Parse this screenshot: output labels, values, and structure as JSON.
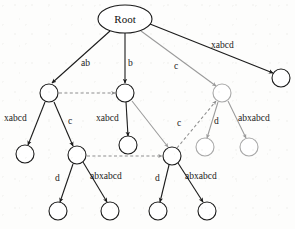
{
  "diagram": {
    "type": "suffix-tree",
    "root": {
      "id": "root",
      "label": "Root",
      "cx": 125,
      "cy": 19,
      "rx": 27,
      "ry": 14,
      "style": "dark"
    },
    "nodes": [
      {
        "id": "n1",
        "cx": 49,
        "cy": 93,
        "r": 9,
        "style": "dark"
      },
      {
        "id": "n2",
        "cx": 125,
        "cy": 93,
        "r": 9,
        "style": "dark"
      },
      {
        "id": "n3",
        "cx": 222,
        "cy": 93,
        "r": 9,
        "style": "gray"
      },
      {
        "id": "n4",
        "cx": 281,
        "cy": 78,
        "r": 9,
        "style": "dark"
      },
      {
        "id": "n5",
        "cx": 25,
        "cy": 154,
        "r": 9,
        "style": "dark"
      },
      {
        "id": "n6",
        "cx": 77,
        "cy": 155,
        "r": 9,
        "style": "dark"
      },
      {
        "id": "n7",
        "cx": 128,
        "cy": 145,
        "r": 9,
        "style": "dark"
      },
      {
        "id": "n8",
        "cx": 172,
        "cy": 156,
        "r": 9,
        "style": "dark"
      },
      {
        "id": "n9",
        "cx": 205,
        "cy": 147,
        "r": 9,
        "style": "gray"
      },
      {
        "id": "n10",
        "cx": 249,
        "cy": 147,
        "r": 9,
        "style": "gray"
      },
      {
        "id": "n11",
        "cx": 58,
        "cy": 211,
        "r": 9,
        "style": "dark"
      },
      {
        "id": "n12",
        "cx": 110,
        "cy": 211,
        "r": 9,
        "style": "dark"
      },
      {
        "id": "n13",
        "cx": 158,
        "cy": 211,
        "r": 9,
        "style": "dark"
      },
      {
        "id": "n14",
        "cx": 207,
        "cy": 211,
        "r": 9,
        "style": "dark"
      }
    ],
    "edges": [
      {
        "id": "e-root-n1",
        "from": "root",
        "to": "n1",
        "x1": 110,
        "y1": 31,
        "x2": 52,
        "y2": 83,
        "style": "dark"
      },
      {
        "id": "e-root-n2",
        "from": "root",
        "to": "n2",
        "x1": 125,
        "y1": 33,
        "x2": 125,
        "y2": 83,
        "style": "dark"
      },
      {
        "id": "e-root-n3",
        "from": "root",
        "to": "n3",
        "x1": 141,
        "y1": 31,
        "x2": 216,
        "y2": 86,
        "style": "gray"
      },
      {
        "id": "e-root-n4",
        "from": "root",
        "to": "n4",
        "x1": 150,
        "y1": 24,
        "x2": 273,
        "y2": 73,
        "style": "dark"
      },
      {
        "id": "e-n1-n5",
        "from": "n1",
        "to": "n5",
        "x1": 45,
        "y1": 102,
        "x2": 28,
        "y2": 145,
        "style": "dark"
      },
      {
        "id": "e-n1-n6",
        "from": "n1",
        "to": "n6",
        "x1": 54,
        "y1": 102,
        "x2": 73,
        "y2": 146,
        "style": "dark"
      },
      {
        "id": "e-n2-n7",
        "from": "n2",
        "to": "n7",
        "x1": 126,
        "y1": 102,
        "x2": 128,
        "y2": 136,
        "style": "dark"
      },
      {
        "id": "e-n2-n8",
        "from": "n2",
        "to": "n8",
        "x1": 132,
        "y1": 101,
        "x2": 168,
        "y2": 147,
        "style": "gray"
      },
      {
        "id": "e-n3-n9",
        "from": "n3",
        "to": "n9",
        "x1": 218,
        "y1": 102,
        "x2": 207,
        "y2": 138,
        "style": "gray"
      },
      {
        "id": "e-n3-n10",
        "from": "n3",
        "to": "n10",
        "x1": 228,
        "y1": 101,
        "x2": 246,
        "y2": 138,
        "style": "gray"
      },
      {
        "id": "e-n6-n11",
        "from": "n6",
        "to": "n11",
        "x1": 73,
        "y1": 164,
        "x2": 60,
        "y2": 202,
        "style": "dark"
      },
      {
        "id": "e-n6-n12",
        "from": "n6",
        "to": "n12",
        "x1": 83,
        "y1": 162,
        "x2": 107,
        "y2": 202,
        "style": "dark"
      },
      {
        "id": "e-n8-n13",
        "from": "n8",
        "to": "n13",
        "x1": 169,
        "y1": 165,
        "x2": 160,
        "y2": 202,
        "style": "dark"
      },
      {
        "id": "e-n8-n14",
        "from": "n8",
        "to": "n14",
        "x1": 178,
        "y1": 163,
        "x2": 203,
        "y2": 202,
        "style": "dark"
      }
    ],
    "suffix_links": [
      {
        "id": "sl-n1-n2",
        "from": "n1",
        "to": "n2",
        "x1": 59,
        "y1": 93,
        "x2": 115,
        "y2": 93,
        "style": "dashed"
      },
      {
        "id": "sl-n6-n8",
        "from": "n6",
        "to": "n8",
        "x1": 87,
        "y1": 156,
        "x2": 162,
        "y2": 156,
        "style": "dashed"
      },
      {
        "id": "sl-n8-n3",
        "from": "n8",
        "to": "n3",
        "x1": 177,
        "y1": 148,
        "x2": 216,
        "y2": 101,
        "style": "dashed"
      }
    ],
    "labels": [
      {
        "id": "lbl-ab",
        "text": "ab",
        "x": 81,
        "y": 66,
        "anchor": "start"
      },
      {
        "id": "lbl-b",
        "text": "b",
        "x": 128,
        "y": 66,
        "anchor": "start"
      },
      {
        "id": "lbl-c-root",
        "text": "c",
        "x": 174,
        "y": 69,
        "anchor": "start"
      },
      {
        "id": "lbl-xabcd-root",
        "text": "xabcd",
        "x": 211,
        "y": 48,
        "anchor": "start"
      },
      {
        "id": "lbl-xabcd-n1",
        "text": "xabcd",
        "x": 4,
        "y": 121,
        "anchor": "start"
      },
      {
        "id": "lbl-c-n1",
        "text": "c",
        "x": 68,
        "y": 124,
        "anchor": "start"
      },
      {
        "id": "lbl-xabcd-n2",
        "text": "xabcd",
        "x": 96,
        "y": 121,
        "anchor": "start"
      },
      {
        "id": "lbl-c-link",
        "text": "c",
        "x": 177,
        "y": 126,
        "anchor": "start"
      },
      {
        "id": "lbl-d-n3",
        "text": "d",
        "x": 214,
        "y": 124,
        "anchor": "start"
      },
      {
        "id": "lbl-abxabcd-n3",
        "text": "abxabcd",
        "x": 238,
        "y": 121,
        "anchor": "start"
      },
      {
        "id": "lbl-d-n6",
        "text": "d",
        "x": 55,
        "y": 181,
        "anchor": "start"
      },
      {
        "id": "lbl-abxabcd-n6",
        "text": "abxabcd",
        "x": 90,
        "y": 179,
        "anchor": "start"
      },
      {
        "id": "lbl-d-n8",
        "text": "d",
        "x": 155,
        "y": 181,
        "anchor": "start"
      },
      {
        "id": "lbl-abxabcd-n8",
        "text": "abxabcd",
        "x": 185,
        "y": 179,
        "anchor": "start"
      }
    ],
    "colors": {
      "ink": "#1b1b1b",
      "gray_edge": "#9a9a9a",
      "gray_node": "#a8a8a8",
      "dashed": "#8d8d8d",
      "background": "#fdfdfc"
    }
  }
}
